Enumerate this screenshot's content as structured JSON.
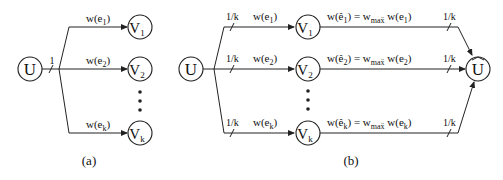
{
  "panel_a": {
    "caption": "(a)",
    "source": "U",
    "split_label": "1",
    "targets": [
      {
        "name": "V",
        "sub": "1",
        "edge": "w(e",
        "edge_sub": "1",
        "edge_close": ")"
      },
      {
        "name": "V",
        "sub": "2",
        "edge": "w(e",
        "edge_sub": "2",
        "edge_close": ")"
      },
      {
        "name": "V",
        "sub": "k",
        "edge": "w(e",
        "edge_sub": "k",
        "edge_close": ")"
      }
    ],
    "ellipsis": "•"
  },
  "panel_b": {
    "caption": "(b)",
    "source": "U",
    "sink": "U",
    "sink_hat": "^",
    "split_label": "1/k",
    "merge_label": "1/k",
    "targets": [
      {
        "name": "V",
        "sub": "1",
        "edge": "w(e",
        "edge_sub": "1",
        "edge_close": ")",
        "out_lhs": "w(ê",
        "out_lhs_sub": "1",
        "out_eq": ") = w",
        "out_max": "maẍ",
        "out_rhs": " w(e",
        "out_rhs_sub": "1",
        "out_close": ")"
      },
      {
        "name": "V",
        "sub": "2",
        "edge": "w(e",
        "edge_sub": "2",
        "edge_close": ")",
        "out_lhs": "w(ê",
        "out_lhs_sub": "2",
        "out_eq": ") = w",
        "out_max": "maẍ",
        "out_rhs": " w(e",
        "out_rhs_sub": "2",
        "out_close": ")"
      },
      {
        "name": "V",
        "sub": "k",
        "edge": "w(e",
        "edge_sub": "k",
        "edge_close": ")",
        "out_lhs": "w(ê",
        "out_lhs_sub": "k",
        "out_eq": ") = w",
        "out_max": "maẍ",
        "out_rhs": " w(e",
        "out_rhs_sub": "k",
        "out_close": ")"
      }
    ],
    "ellipsis": "•"
  }
}
